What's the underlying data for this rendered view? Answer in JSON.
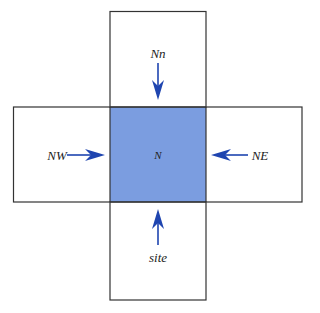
{
  "diagram": {
    "center_label": "N",
    "labels": {
      "top": "Nn",
      "left": "NW",
      "right": "NE",
      "bottom": "site"
    },
    "colors": {
      "center_fill": "#7b9de0",
      "arrow": "#1f45b0",
      "border": "#333333",
      "background": "#ffffff"
    },
    "arrows": [
      {
        "from": "top",
        "direction": "down"
      },
      {
        "from": "left",
        "direction": "right"
      },
      {
        "from": "right",
        "direction": "left"
      },
      {
        "from": "bottom",
        "direction": "up"
      }
    ]
  }
}
